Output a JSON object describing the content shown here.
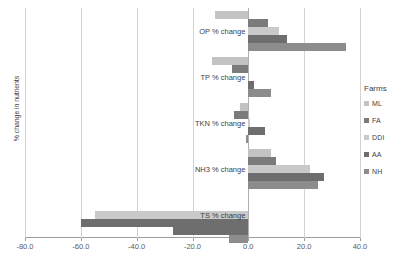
{
  "chart_data": {
    "type": "bar",
    "orientation": "horizontal",
    "title": "",
    "xlabel": "",
    "ylabel": "% change in nutrients",
    "xlim": [
      -80.0,
      40.0
    ],
    "xticks": [
      -80.0,
      -60.0,
      -40.0,
      -20.0,
      0.0,
      20.0,
      40.0
    ],
    "xtick_labels": [
      "-80.0",
      "-60.0",
      "-40.0",
      "-20.0",
      "0.0",
      "20.0",
      "40.0"
    ],
    "grid": true,
    "legend_position": "right",
    "legend_title": "Farms",
    "categories": [
      "OP % change",
      "TP % change",
      "TKN % change",
      "NH3 % change",
      "TS % change"
    ],
    "series": [
      {
        "name": "ML",
        "color": "#c3c3c3",
        "values": [
          -12.0,
          -13.0,
          -3.0,
          8.0,
          0.0
        ]
      },
      {
        "name": "FA",
        "color": "#7b7b7b",
        "values": [
          7.0,
          -6.0,
          -5.0,
          10.0,
          0.0
        ]
      },
      {
        "name": "DDI",
        "color": "#c9c9c9",
        "values": [
          11.0,
          0.0,
          0.5,
          22.0,
          -55.0
        ]
      },
      {
        "name": "AA",
        "color": "#6e6e6e",
        "values": [
          14.0,
          2.0,
          6.0,
          27.0,
          -60.0
        ]
      },
      {
        "name": "NH",
        "color": "#8c8c8c",
        "values": [
          35.0,
          8.0,
          -1.0,
          25.0,
          -26.0
        ]
      }
    ],
    "extra_bars": [
      {
        "category": "TS % change",
        "series": "AA-lower",
        "value": -27.0,
        "color": "#6e6e6e"
      },
      {
        "category": "TS % change",
        "series": "NH-lower",
        "value": -7.0,
        "color": "#8c8c8c"
      }
    ]
  },
  "legend": {
    "title": "Farms",
    "items": [
      {
        "label": "ML",
        "color": "#c3c3c3"
      },
      {
        "label": "FA",
        "color": "#7b7b7b"
      },
      {
        "label": "DDI",
        "color": "#c9c9c9"
      },
      {
        "label": "AA",
        "color": "#6e6e6e"
      },
      {
        "label": "NH",
        "color": "#8c8c8c"
      }
    ]
  },
  "axes": {
    "y_title": "% change in nutrients",
    "x_tick_labels": [
      "-80.0",
      "-60.0",
      "-40.0",
      "-20.0",
      "0.0",
      "20.0",
      "40.0"
    ]
  }
}
